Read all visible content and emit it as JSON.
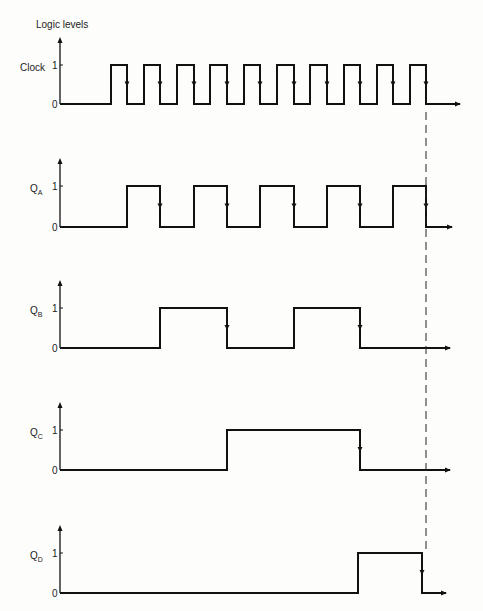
{
  "diagram": {
    "title": "Logic levels",
    "type": "timing-diagram",
    "clock_period_px": 33.3,
    "signals": [
      {
        "key": "clock",
        "label": "Clock",
        "sub": "",
        "y1": 65,
        "y0": 104,
        "edges": [
          [
            60,
            0
          ],
          [
            111,
            1
          ],
          [
            127,
            0
          ],
          [
            144,
            1
          ],
          [
            160,
            0
          ],
          [
            177,
            1
          ],
          [
            194,
            0
          ],
          [
            210,
            1
          ],
          [
            227,
            0
          ],
          [
            244,
            1
          ],
          [
            260,
            0
          ],
          [
            277,
            1
          ],
          [
            294,
            0
          ],
          [
            310,
            1
          ],
          [
            327,
            0
          ],
          [
            344,
            1
          ],
          [
            360,
            0
          ],
          [
            377,
            1
          ],
          [
            393,
            0
          ],
          [
            410,
            1
          ],
          [
            426,
            0
          ],
          [
            460,
            0
          ]
        ],
        "falling_arrows": [
          127,
          160,
          194,
          227,
          260,
          294,
          327,
          360,
          393,
          426
        ]
      },
      {
        "key": "qa",
        "label": "Q",
        "sub": "A",
        "y1": 186,
        "y0": 227,
        "edges": [
          [
            60,
            0
          ],
          [
            127,
            1
          ],
          [
            160,
            0
          ],
          [
            194,
            1
          ],
          [
            227,
            0
          ],
          [
            260,
            1
          ],
          [
            294,
            0
          ],
          [
            327,
            1
          ],
          [
            360,
            0
          ],
          [
            393,
            1
          ],
          [
            426,
            0
          ],
          [
            452,
            0
          ]
        ],
        "falling_arrows": [
          160,
          227,
          294,
          360,
          426
        ]
      },
      {
        "key": "qb",
        "label": "Q",
        "sub": "B",
        "y1": 308,
        "y0": 348,
        "edges": [
          [
            60,
            0
          ],
          [
            160,
            1
          ],
          [
            227,
            0
          ],
          [
            294,
            1
          ],
          [
            360,
            0
          ],
          [
            450,
            0
          ]
        ],
        "falling_arrows": [
          227,
          360
        ]
      },
      {
        "key": "qc",
        "label": "Q",
        "sub": "C",
        "y1": 430,
        "y0": 470,
        "edges": [
          [
            60,
            0
          ],
          [
            227,
            1
          ],
          [
            360,
            0
          ],
          [
            450,
            0
          ]
        ],
        "falling_arrows": [
          360
        ]
      },
      {
        "key": "qd",
        "label": "Q",
        "sub": "D",
        "y1": 553,
        "y0": 593,
        "edges": [
          [
            60,
            0
          ],
          [
            358,
            1
          ],
          [
            422,
            0
          ],
          [
            446,
            0
          ]
        ],
        "falling_arrows": [
          422
        ]
      }
    ],
    "ticks": {
      "high": "1",
      "low": "0"
    },
    "dashed_marker_x": 426
  }
}
